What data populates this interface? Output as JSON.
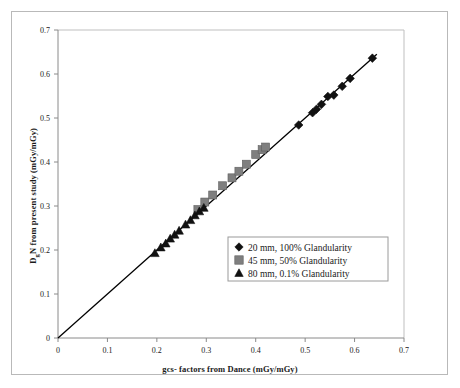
{
  "chart_data": {
    "type": "scatter",
    "title": "",
    "xlabel": "gcs- factors from Dance (mGy/mGy)",
    "ylabel_parts": {
      "pre": "D",
      "sub": "g",
      "post": "N from present study (mGy/mGy)"
    },
    "ylabel": "DgN from present study (mGy/mGy)",
    "xlim": [
      0,
      0.7
    ],
    "ylim": [
      0,
      0.7
    ],
    "xticks": [
      "0",
      "0.1",
      "0.2",
      "0.3",
      "0.4",
      "0.5",
      "0.6",
      "0.7"
    ],
    "xtick_values": [
      0,
      0.1,
      0.2,
      0.3,
      0.4,
      0.5,
      0.6,
      0.7
    ],
    "yticks": [
      "0",
      "0.1",
      "0.2",
      "0.3",
      "0.4",
      "0.5",
      "0.6",
      "0.7"
    ],
    "ytick_values": [
      0,
      0.1,
      0.2,
      0.3,
      0.4,
      0.5,
      0.6,
      0.7
    ],
    "grid": false,
    "legend_position": "center",
    "fit_line": {
      "name": "identity-line",
      "x": [
        0.0,
        0.645
      ],
      "y": [
        0.0,
        0.645
      ],
      "color": "#000000"
    },
    "series": [
      {
        "name": "20 mm, 100% Glandularity",
        "marker": "diamond",
        "color": "#111111",
        "points": [
          [
            0.487,
            0.484
          ],
          [
            0.515,
            0.512
          ],
          [
            0.523,
            0.52
          ],
          [
            0.533,
            0.531
          ],
          [
            0.546,
            0.549
          ],
          [
            0.558,
            0.552
          ],
          [
            0.575,
            0.572
          ],
          [
            0.591,
            0.59
          ],
          [
            0.636,
            0.636
          ]
        ]
      },
      {
        "name": "45 mm, 50% Glandularity",
        "marker": "square",
        "color": "#7f7f7f",
        "points": [
          [
            0.283,
            0.292
          ],
          [
            0.297,
            0.309
          ],
          [
            0.313,
            0.325
          ],
          [
            0.333,
            0.346
          ],
          [
            0.352,
            0.364
          ],
          [
            0.366,
            0.379
          ],
          [
            0.381,
            0.395
          ],
          [
            0.4,
            0.417
          ],
          [
            0.413,
            0.428
          ],
          [
            0.42,
            0.434
          ]
        ]
      },
      {
        "name": "80 mm, 0.1% Glandularity",
        "marker": "triangle",
        "color": "#111111",
        "points": [
          [
            0.196,
            0.193
          ],
          [
            0.208,
            0.206
          ],
          [
            0.218,
            0.215
          ],
          [
            0.227,
            0.226
          ],
          [
            0.236,
            0.235
          ],
          [
            0.245,
            0.244
          ],
          [
            0.258,
            0.258
          ],
          [
            0.268,
            0.268
          ],
          [
            0.277,
            0.279
          ],
          [
            0.286,
            0.288
          ],
          [
            0.295,
            0.296
          ]
        ]
      }
    ]
  },
  "legend": {
    "items": [
      {
        "marker": "diamond",
        "color": "#111111",
        "label": "20 mm, 100% Glandularity"
      },
      {
        "marker": "square",
        "color": "#7f7f7f",
        "label": "45 mm, 50% Glandularity"
      },
      {
        "marker": "triangle",
        "color": "#111111",
        "label": "80 mm, 0.1% Glandularity"
      }
    ]
  }
}
